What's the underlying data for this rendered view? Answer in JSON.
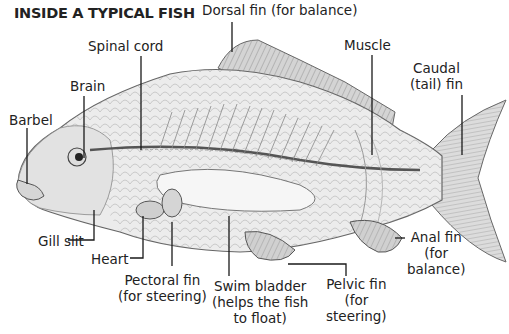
{
  "title": "INSIDE A TYPICAL FISH",
  "labels": {
    "dorsal_fin": "Dorsal fin (for balance)",
    "spinal_cord": "Spinal cord",
    "muscle": "Muscle",
    "caudal_fin_1": "Caudal",
    "caudal_fin_2": "(tail) fin",
    "brain": "Brain",
    "barbel": "Barbel",
    "gill_slit": "Gill slit",
    "heart": "Heart",
    "pectoral_fin_1": "Pectoral fin",
    "pectoral_fin_2": "(for steering)",
    "swim_bladder_1": "Swim bladder",
    "swim_bladder_2": "(helps the fish",
    "swim_bladder_3": "to float)",
    "pelvic_fin_1": "Pelvic fin",
    "pelvic_fin_2": "(for",
    "pelvic_fin_3": "steering)",
    "anal_fin_1": "Anal fin",
    "anal_fin_2": "(for",
    "anal_fin_3": "balance)"
  },
  "colors": {
    "line": "#1a1a1a",
    "body_fill": "#e9e9e9",
    "body_stroke": "#6a6a6a",
    "fin_fill": "#d9d9d9"
  }
}
